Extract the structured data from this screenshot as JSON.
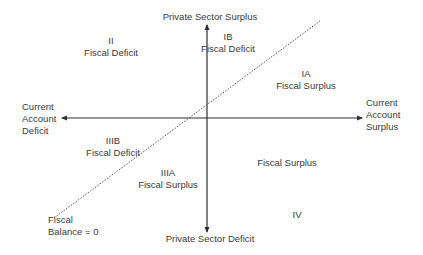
{
  "axes": {
    "top_label": "Private Sector Surplus",
    "bottom_label": "Private Sector Deficit",
    "left_label": [
      "Current",
      "Account",
      "Deficit"
    ],
    "right_label": [
      "Current",
      "Account",
      "Surplus"
    ]
  },
  "diagonal": {
    "label": [
      "Fiscal",
      "Balance = 0"
    ],
    "style": "dotted"
  },
  "regions": [
    {
      "id": "II",
      "numeral": "II",
      "text": "Fiscal Deficit"
    },
    {
      "id": "IB",
      "numeral": "IB",
      "text": "Fiscal Deficit"
    },
    {
      "id": "IA",
      "numeral": "IA",
      "text": "Fiscal Surplus"
    },
    {
      "id": "IIIB",
      "numeral": "IIIB",
      "text": "Fiscal Deficit"
    },
    {
      "id": "IIIA",
      "numeral": "IIIA",
      "text": "Fiscal Surplus"
    },
    {
      "id": "IV-text",
      "numeral": "",
      "text": "Fiscal Surplus"
    },
    {
      "id": "IV",
      "numeral": "IV",
      "text": ""
    }
  ],
  "colors": {
    "line": "#2e2e2e",
    "text": "#3a3a3a"
  }
}
